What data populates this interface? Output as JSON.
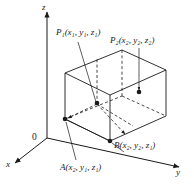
{
  "figure": {
    "kind": "3d-coordinate-box-diagram",
    "background_color": "#ffffff",
    "line_color": "#1a1a1a",
    "axes": {
      "z_label": "z",
      "x_label": "x",
      "y_label": "y",
      "origin_label": "0"
    },
    "points": {
      "p1": {
        "name": "P",
        "subscript": "1",
        "coords": [
          "x",
          "y",
          "z"
        ],
        "coord_subs": [
          "1",
          "1",
          "1"
        ],
        "label_text": "P₁(x₁, y₁, z₁)"
      },
      "p2": {
        "name": "P",
        "subscript": "2",
        "coords": [
          "x",
          "y",
          "z"
        ],
        "coord_subs": [
          "2",
          "2",
          "2"
        ],
        "label_text": "P₂(x₂, y₂, z₂)"
      },
      "a": {
        "name": "A",
        "subscript": "",
        "coords": [
          "x",
          "y",
          "z"
        ],
        "coord_subs": [
          "2",
          "1",
          "1"
        ],
        "label_text": "A(x₂, y₁, z₁)"
      },
      "b": {
        "name": "B",
        "subscript": "",
        "coords": [
          "x",
          "y",
          "z"
        ],
        "coord_subs": [
          "2",
          "2",
          "1"
        ],
        "label_text": "B(x₂, y₂, z₁)"
      }
    },
    "geometry": {
      "description": "rectangular box drawn in oblique projection with solid visible edges and dashed hidden edges; dashed segments connect P1 to A and to B"
    }
  }
}
